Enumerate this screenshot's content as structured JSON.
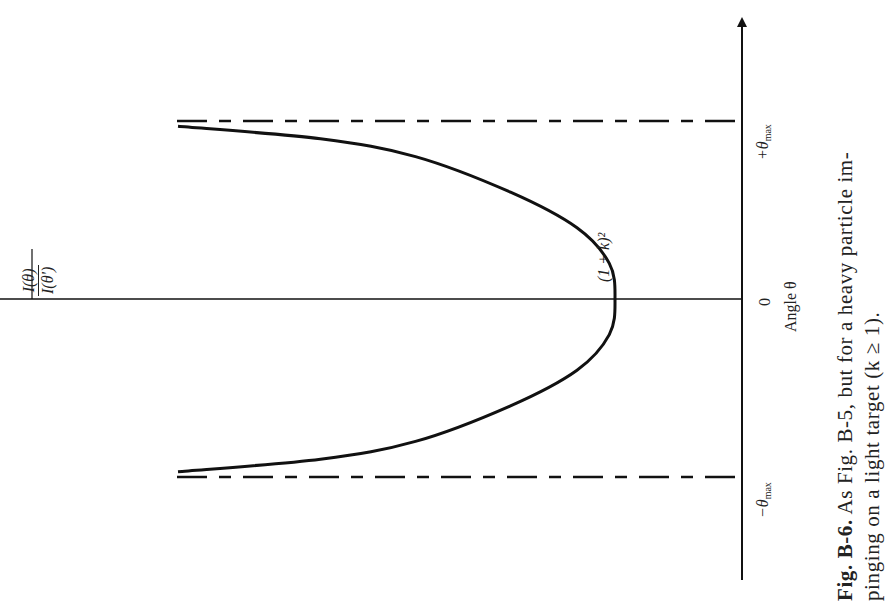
{
  "figure": {
    "caption_label": "Fig. B-6.",
    "caption_line1": "As Fig. B-5, but for a heavy particle im-",
    "caption_line2": "pinging on a light target (k ≥ 1).",
    "orientation": "rotated 90 degrees (text reads bottom-to-top)"
  },
  "chart_data": {
    "type": "line",
    "title": "",
    "xlabel": "Angle θ",
    "ylabel": "I(θ)/I(θ')",
    "ylabel_num": "I(θ)",
    "ylabel_den": "I(θ')",
    "x_ticks": [
      {
        "value": -1,
        "label": "−θ",
        "sub": "max"
      },
      {
        "value": 0,
        "label": "0",
        "sub": ""
      },
      {
        "value": 1,
        "label": "+θ",
        "sub": "max"
      }
    ],
    "xlim": [
      -1.0,
      1.0
    ],
    "ylim": [
      0,
      3.6
    ],
    "annotations": [
      {
        "text": "(1 + k)²",
        "at": "curve minimum at θ = 0"
      }
    ],
    "asymptotes": [
      {
        "x": -1,
        "style": "dashed",
        "label": "−θmax"
      },
      {
        "x": 1,
        "style": "dashed",
        "label": "+θmax"
      }
    ],
    "series": [
      {
        "name": "I(θ)/I(θ')",
        "style": "solid",
        "x": [
          -0.97,
          -0.9,
          -0.8,
          -0.6,
          -0.4,
          -0.2,
          0.0,
          0.2,
          0.4,
          0.6,
          0.8,
          0.9,
          0.97
        ],
        "y": [
          3.3,
          2.55,
          2.05,
          1.55,
          1.2,
          1.03,
          1.0,
          1.03,
          1.2,
          1.55,
          2.05,
          2.55,
          3.3
        ]
      }
    ],
    "grid": false,
    "legend": "none"
  }
}
